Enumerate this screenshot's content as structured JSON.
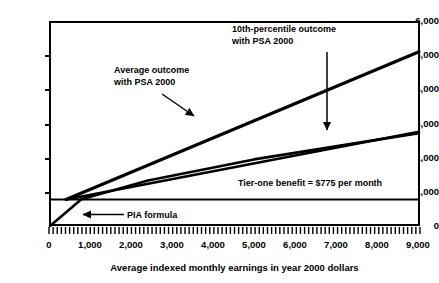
{
  "chart_data": {
    "type": "line",
    "title": "",
    "xlabel": "Average indexed monthly earnings in year 2000 dollars",
    "ylabel": "",
    "xlim": [
      0,
      9270
    ],
    "ylim": [
      0,
      6000
    ],
    "grid": false,
    "legend_position": "inline-annotations",
    "x_ticks": [
      "0",
      "1,000",
      "2,000",
      "3,000",
      "4,000",
      "5,000",
      "6,000",
      "7,000",
      "8,000",
      "9,000"
    ],
    "x_tick_values": [
      0,
      1000,
      2000,
      3000,
      4000,
      5000,
      6000,
      7000,
      8000,
      9000
    ],
    "y_ticks": [
      "0",
      "1,000",
      "2,000",
      "3,000",
      "4,000",
      "5,000",
      "6,000"
    ],
    "y_tick_values": [
      0,
      1000,
      2000,
      3000,
      4000,
      5000,
      6000
    ],
    "series": [
      {
        "name": "Average outcome with PSA 2000",
        "points": [
          [
            400,
            775
          ],
          [
            9270,
            5100
          ]
        ]
      },
      {
        "name": "10th-percentile outcome with PSA 2000",
        "points": [
          [
            400,
            775
          ],
          [
            9270,
            2760
          ]
        ]
      },
      {
        "name": "PIA formula",
        "points": [
          [
            0,
            0
          ],
          [
            760,
            780
          ],
          [
            2400,
            1330
          ],
          [
            5000,
            1950
          ],
          [
            9270,
            2720
          ]
        ]
      },
      {
        "name": "Tier-one benefit = $775 per month",
        "points": [
          [
            0,
            775
          ],
          [
            9270,
            775
          ]
        ]
      }
    ],
    "annotations": [
      {
        "name": "average-outcome-label",
        "text_line1": "Average outcome",
        "text_line2": "with PSA 2000",
        "arrow": "down-right"
      },
      {
        "name": "tenth-percentile-label",
        "text_line1": "10th-percentile outcome",
        "text_line2": "with PSA 2000",
        "arrow": "down"
      },
      {
        "name": "tier-one-benefit-label",
        "text_line1": "Tier-one benefit = $775 per month",
        "arrow": "none"
      },
      {
        "name": "pia-formula-label",
        "text_line1": "PIA formula",
        "arrow": "left"
      }
    ],
    "colors": {
      "line": "#000000",
      "axis": "#000000",
      "background": "#ffffff"
    }
  }
}
